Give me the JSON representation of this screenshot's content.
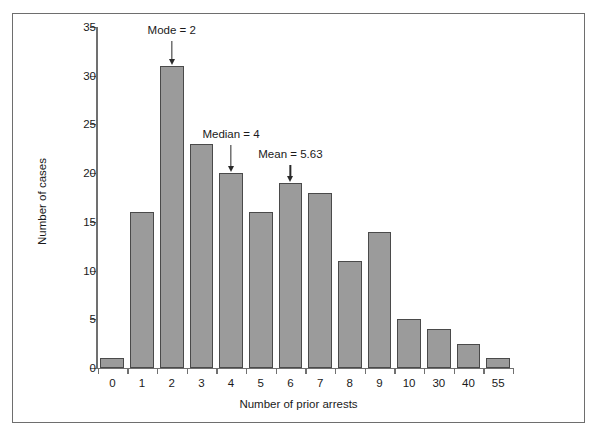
{
  "chart_data": {
    "type": "bar",
    "title": "",
    "xlabel": "Number of prior arrests",
    "ylabel": "Number of cases",
    "categories": [
      "0",
      "1",
      "2",
      "3",
      "4",
      "5",
      "6",
      "7",
      "8",
      "9",
      "10",
      "30",
      "40",
      "55"
    ],
    "values": [
      1,
      16,
      31,
      23,
      20,
      16,
      19,
      18,
      11,
      14,
      5,
      4,
      2.5,
      1
    ],
    "ylim": [
      0,
      35
    ],
    "y_ticks": [
      0,
      5,
      10,
      15,
      20,
      25,
      30,
      35
    ],
    "y_tick_labels": [
      "0",
      "5",
      "10",
      "15",
      "20",
      "25",
      "30",
      "35"
    ],
    "grid": false,
    "legend": "none",
    "bar_fill_color": "#9b9b9b",
    "bar_edge_color": "#4a4a4a",
    "axis_color": "#707070",
    "frame_color": "#6e6e6e",
    "annotations": [
      {
        "text": "Mode = 2",
        "category": "2",
        "value": 2
      },
      {
        "text": "Median = 4",
        "category": "4",
        "value": 4
      },
      {
        "text": "Mean = 5.63",
        "category": "6",
        "value": 5.63
      }
    ]
  }
}
